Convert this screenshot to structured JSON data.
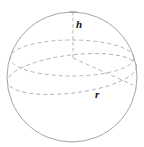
{
  "figure": {
    "type": "geometry-diagram",
    "background_color": "#ffffff",
    "stroke_color": "#9a9a9a",
    "dash_color": "#a6a6a6",
    "label_color": "#111111",
    "labels": [
      {
        "id": "h",
        "text": "h",
        "meaning": "height from top of sphere to cross-section plane",
        "x": 76,
        "y": 19
      },
      {
        "id": "r",
        "text": "r",
        "meaning": "radius of the horizontal circular cross-section",
        "x": 95,
        "y": 89
      }
    ],
    "geometry": {
      "sphere": {
        "center_x": 72,
        "center_y": 77,
        "radius": 65,
        "style": "solid"
      },
      "cross_section_ellipse": {
        "center_x": 72,
        "center_y": 58,
        "rx": 62,
        "ry": 18,
        "style": "dashed"
      },
      "great_circle_ellipse": {
        "center_x": 72,
        "center_y": 74,
        "rx": 65,
        "ry": 19,
        "rotation_deg": -7,
        "style": "dashed"
      },
      "height_segment": {
        "x": 73,
        "y_top": 12,
        "y_bottom": 58,
        "style": "dashed"
      },
      "top_tick": {
        "x": 73,
        "y": 12,
        "half_width": 4,
        "style": "solid"
      },
      "radius_segment": {
        "x1": 73,
        "y1": 58,
        "x2": 133,
        "y2": 85,
        "style": "dashed"
      }
    }
  }
}
